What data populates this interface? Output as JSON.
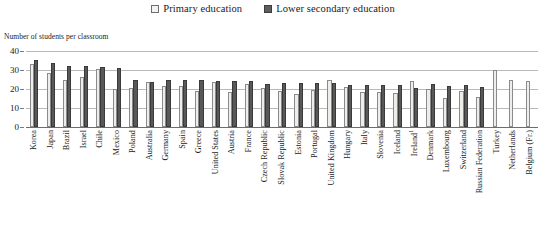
{
  "legend": {
    "position": "top-center",
    "entries": [
      {
        "label": "Primary education",
        "marker": "open-square",
        "color": "#ededea"
      },
      {
        "label": "Lower secondary education",
        "marker": "filled-square",
        "color": "#585858"
      }
    ]
  },
  "axis_caption": "Number of students per classroom",
  "yticks": [
    "0",
    "10",
    "20",
    "30",
    "40"
  ],
  "chart_data": {
    "type": "bar",
    "title": "",
    "subtitle": "",
    "xlabel": "",
    "ylabel": "Number of students per classroom",
    "ylim": [
      0,
      40
    ],
    "yticks": [
      0,
      10,
      20,
      30,
      40
    ],
    "grid": true,
    "legend_position": "top-center",
    "categories": [
      "Korea",
      "Japan",
      "Brazil",
      "Israel",
      "Chile",
      "Mexico",
      "Poland",
      "Australia",
      "Germany",
      "Spain",
      "Greece",
      "United States",
      "Austria",
      "France",
      "Czech Republic",
      "Slovak Republic",
      "Estonia",
      "Portugal",
      "United Kingdom",
      "Hungary",
      "Italy",
      "Slovenia",
      "Iceland",
      "Ireland",
      "Denmark",
      "Luxembourg",
      "Switzerland",
      "Russian Federation",
      "Turkey",
      "Netherlands",
      "Belgium (Fr.)"
    ],
    "series": [
      {
        "name": "Primary education",
        "values": [
          33.0,
          28.5,
          25.0,
          26.5,
          30.5,
          20.0,
          20.5,
          23.5,
          21.5,
          21.5,
          19.0,
          23.5,
          18.5,
          22.5,
          20.5,
          19.0,
          17.5,
          19.5,
          24.5,
          21.0,
          18.5,
          18.5,
          18.0,
          24.0,
          20.0,
          15.5,
          19.0,
          16.0,
          30.0,
          25.0,
          24.0
        ]
      },
      {
        "name": "Lower secondary education",
        "values": [
          35.5,
          33.5,
          32.0,
          32.0,
          31.5,
          31.0,
          24.5,
          23.5,
          24.5,
          24.5,
          25.0,
          24.0,
          24.0,
          24.0,
          22.5,
          23.0,
          23.0,
          23.0,
          23.0,
          22.0,
          22.0,
          22.0,
          22.0,
          20.5,
          22.5,
          21.5,
          22.0,
          21.0,
          null,
          null,
          null
        ]
      }
    ]
  }
}
